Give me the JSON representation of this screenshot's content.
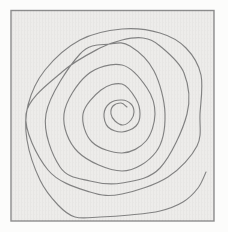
{
  "figure": {
    "background_color": "#fcfcfb",
    "paper_color": "#edecea",
    "paper_texture_color": "#e3e2df",
    "border_color": "#8d8d8d",
    "line_color": "#828282",
    "border_width": 1.4,
    "stroke_width": 1.15,
    "frame": {
      "x": 11,
      "y": 10.5,
      "width": 203,
      "height": 210.5
    },
    "spiral": {
      "type": "freehand-spiral",
      "turns": 5.5,
      "center": [
        122,
        114
      ],
      "winding": "counterclockwise-outward",
      "points": [
        [
          127,
          107
        ],
        [
          121,
          103
        ],
        [
          113,
          106
        ],
        [
          111,
          114
        ],
        [
          115,
          121
        ],
        [
          123,
          125
        ],
        [
          131,
          120
        ],
        [
          134,
          112
        ],
        [
          131,
          104
        ],
        [
          122,
          100
        ],
        [
          110,
          103
        ],
        [
          104,
          114
        ],
        [
          108,
          127
        ],
        [
          122,
          132
        ],
        [
          136,
          126
        ],
        [
          140,
          114
        ],
        [
          136,
          99
        ],
        [
          122,
          84
        ],
        [
          101,
          90
        ],
        [
          83,
          114
        ],
        [
          92,
          142
        ],
        [
          122,
          153
        ],
        [
          146,
          141
        ],
        [
          155,
          114
        ],
        [
          147,
          88
        ],
        [
          122,
          65
        ],
        [
          87,
          75
        ],
        [
          64,
          114
        ],
        [
          78,
          152
        ],
        [
          122,
          171
        ],
        [
          156,
          152
        ],
        [
          165,
          114
        ],
        [
          154,
          71
        ],
        [
          130,
          46
        ],
        [
          110,
          44
        ],
        [
          80,
          54
        ],
        [
          46,
          114
        ],
        [
          60,
          167
        ],
        [
          90,
          181
        ],
        [
          122,
          183
        ],
        [
          160,
          168
        ],
        [
          187,
          114
        ],
        [
          184,
          73
        ],
        [
          160,
          46
        ],
        [
          143,
          38
        ],
        [
          122,
          40
        ],
        [
          100,
          48
        ],
        [
          62,
          72
        ],
        [
          26,
          114
        ],
        [
          48,
          170
        ],
        [
          90,
          192
        ],
        [
          122,
          194
        ],
        [
          168,
          177
        ],
        [
          197,
          146
        ],
        [
          200,
          114
        ],
        [
          201,
          75
        ],
        [
          186,
          48
        ],
        [
          160,
          33
        ],
        [
          122,
          29
        ],
        [
          80,
          40
        ],
        [
          45,
          70
        ],
        [
          28,
          105
        ],
        [
          27,
          140
        ],
        [
          40,
          180
        ],
        [
          58,
          205
        ],
        [
          75,
          217
        ],
        [
          100,
          217
        ],
        [
          130,
          215
        ],
        [
          160,
          211
        ],
        [
          183,
          202
        ],
        [
          198,
          188
        ],
        [
          206,
          172
        ]
      ]
    }
  }
}
